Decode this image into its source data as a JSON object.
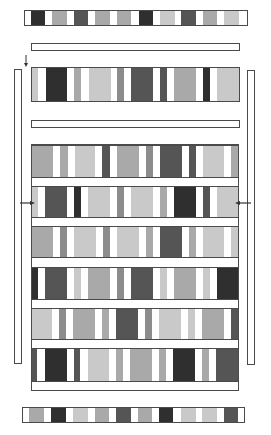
{
  "palette": {
    "W": "#ffffff",
    "D": "#2f2f2f",
    "DM": "#555555",
    "M": "#8c8c8c",
    "ML": "#a9a9a9",
    "L": "#c9c9c9",
    "border": "#4a4a4a"
  },
  "top_strip": {
    "box": [
      24,
      10,
      224,
      16
    ],
    "segments": [
      [
        24,
        31,
        "W"
      ],
      [
        31,
        45,
        "D"
      ],
      [
        45,
        52,
        "W"
      ],
      [
        52,
        67,
        "ML"
      ],
      [
        67,
        74,
        "W"
      ],
      [
        74,
        88,
        "DM"
      ],
      [
        88,
        95,
        "W"
      ],
      [
        95,
        110,
        "ML"
      ],
      [
        110,
        117,
        "W"
      ],
      [
        117,
        131,
        "ML"
      ],
      [
        131,
        139,
        "W"
      ],
      [
        139,
        153,
        "D"
      ],
      [
        153,
        160,
        "W"
      ],
      [
        160,
        175,
        "L"
      ],
      [
        175,
        181,
        "W"
      ],
      [
        181,
        196,
        "DM"
      ],
      [
        196,
        203,
        "W"
      ],
      [
        203,
        217,
        "ML"
      ],
      [
        217,
        224,
        "W"
      ],
      [
        224,
        239,
        "L"
      ],
      [
        239,
        248,
        "W"
      ]
    ]
  },
  "separator_bars": [
    {
      "box": [
        31,
        43,
        209,
        8
      ]
    },
    {
      "box": [
        31,
        120,
        209,
        8
      ]
    }
  ],
  "arrows": [
    {
      "name": "entry-arrow-down",
      "direction": "down",
      "x": 26,
      "y1": 55,
      "y2": 67
    },
    {
      "name": "left-arrow-right",
      "direction": "right",
      "y": 203,
      "x1": 20,
      "x2": 35
    },
    {
      "name": "right-arrow-left",
      "direction": "left",
      "y": 203,
      "x1": 251,
      "x2": 235
    }
  ],
  "side_bars": [
    {
      "name": "left-vertical-bar",
      "box": [
        14,
        69,
        8,
        295
      ]
    },
    {
      "name": "right-vertical-bar",
      "box": [
        247,
        70,
        8,
        295
      ]
    }
  ],
  "single_band": {
    "box": [
      31,
      67,
      209,
      35
    ],
    "segments": [
      [
        31,
        38,
        "L"
      ],
      [
        38,
        46,
        "W"
      ],
      [
        46,
        67,
        "D"
      ],
      [
        67,
        74,
        "W"
      ],
      [
        74,
        81,
        "ML"
      ],
      [
        81,
        89,
        "W"
      ],
      [
        89,
        111,
        "L"
      ],
      [
        111,
        117,
        "W"
      ],
      [
        117,
        124,
        "M"
      ],
      [
        124,
        131,
        "W"
      ],
      [
        131,
        153,
        "DM"
      ],
      [
        153,
        160,
        "W"
      ],
      [
        160,
        167,
        "DM"
      ],
      [
        167,
        174,
        "W"
      ],
      [
        174,
        196,
        "ML"
      ],
      [
        196,
        203,
        "W"
      ],
      [
        203,
        210,
        "D"
      ],
      [
        210,
        217,
        "W"
      ],
      [
        217,
        240,
        "L"
      ]
    ]
  },
  "grid": {
    "box": [
      31,
      144,
      208,
      247
    ],
    "rows": [
      {
        "y": 145,
        "h": 33,
        "segments": [
          [
            31,
            53,
            "ML"
          ],
          [
            53,
            60,
            "W"
          ],
          [
            60,
            68,
            "ML"
          ],
          [
            68,
            75,
            "W"
          ],
          [
            75,
            95,
            "L"
          ],
          [
            95,
            102,
            "W"
          ],
          [
            102,
            110,
            "DM"
          ],
          [
            110,
            117,
            "W"
          ],
          [
            117,
            139,
            "ML"
          ],
          [
            139,
            146,
            "W"
          ],
          [
            146,
            153,
            "M"
          ],
          [
            153,
            160,
            "W"
          ],
          [
            160,
            182,
            "DM"
          ],
          [
            182,
            189,
            "W"
          ],
          [
            189,
            196,
            "DM"
          ],
          [
            196,
            203,
            "W"
          ],
          [
            203,
            224,
            "L"
          ],
          [
            224,
            231,
            "W"
          ],
          [
            231,
            239,
            "ML"
          ]
        ]
      },
      {
        "y": 186,
        "h": 32,
        "segments": [
          [
            31,
            38,
            "L"
          ],
          [
            38,
            45,
            "W"
          ],
          [
            45,
            67,
            "DM"
          ],
          [
            67,
            74,
            "W"
          ],
          [
            74,
            81,
            "D"
          ],
          [
            81,
            88,
            "W"
          ],
          [
            88,
            110,
            "L"
          ],
          [
            110,
            117,
            "W"
          ],
          [
            117,
            124,
            "M"
          ],
          [
            124,
            131,
            "W"
          ],
          [
            131,
            153,
            "L"
          ],
          [
            153,
            160,
            "W"
          ],
          [
            160,
            167,
            "ML"
          ],
          [
            167,
            174,
            "W"
          ],
          [
            174,
            196,
            "D"
          ],
          [
            196,
            203,
            "W"
          ],
          [
            203,
            210,
            "DM"
          ],
          [
            210,
            217,
            "W"
          ],
          [
            217,
            239,
            "L"
          ]
        ]
      },
      {
        "y": 226,
        "h": 32,
        "segments": [
          [
            31,
            53,
            "ML"
          ],
          [
            53,
            60,
            "W"
          ],
          [
            60,
            67,
            "M"
          ],
          [
            67,
            74,
            "W"
          ],
          [
            74,
            96,
            "L"
          ],
          [
            96,
            103,
            "W"
          ],
          [
            103,
            110,
            "M"
          ],
          [
            110,
            117,
            "W"
          ],
          [
            117,
            139,
            "L"
          ],
          [
            139,
            146,
            "W"
          ],
          [
            146,
            153,
            "ML"
          ],
          [
            153,
            160,
            "W"
          ],
          [
            160,
            182,
            "DM"
          ],
          [
            182,
            189,
            "W"
          ],
          [
            189,
            196,
            "ML"
          ],
          [
            196,
            203,
            "W"
          ],
          [
            203,
            224,
            "L"
          ],
          [
            224,
            231,
            "W"
          ],
          [
            231,
            239,
            "L"
          ]
        ]
      },
      {
        "y": 267,
        "h": 33,
        "segments": [
          [
            31,
            38,
            "D"
          ],
          [
            38,
            45,
            "W"
          ],
          [
            45,
            67,
            "DM"
          ],
          [
            67,
            74,
            "W"
          ],
          [
            74,
            81,
            "L"
          ],
          [
            81,
            88,
            "W"
          ],
          [
            88,
            110,
            "ML"
          ],
          [
            110,
            117,
            "W"
          ],
          [
            117,
            124,
            "M"
          ],
          [
            124,
            131,
            "W"
          ],
          [
            131,
            153,
            "DM"
          ],
          [
            153,
            160,
            "W"
          ],
          [
            160,
            167,
            "L"
          ],
          [
            167,
            174,
            "W"
          ],
          [
            174,
            196,
            "ML"
          ],
          [
            196,
            203,
            "W"
          ],
          [
            203,
            210,
            "L"
          ],
          [
            210,
            217,
            "W"
          ],
          [
            217,
            239,
            "D"
          ]
        ]
      },
      {
        "y": 308,
        "h": 32,
        "segments": [
          [
            31,
            52,
            "L"
          ],
          [
            52,
            59,
            "W"
          ],
          [
            59,
            66,
            "M"
          ],
          [
            66,
            73,
            "W"
          ],
          [
            73,
            95,
            "ML"
          ],
          [
            95,
            102,
            "W"
          ],
          [
            102,
            109,
            "ML"
          ],
          [
            109,
            116,
            "W"
          ],
          [
            116,
            138,
            "DM"
          ],
          [
            138,
            145,
            "W"
          ],
          [
            145,
            152,
            "M"
          ],
          [
            152,
            159,
            "W"
          ],
          [
            159,
            181,
            "L"
          ],
          [
            181,
            188,
            "W"
          ],
          [
            188,
            195,
            "L"
          ],
          [
            195,
            202,
            "W"
          ],
          [
            202,
            224,
            "ML"
          ],
          [
            224,
            231,
            "W"
          ],
          [
            231,
            239,
            "DM"
          ]
        ]
      },
      {
        "y": 348,
        "h": 34,
        "segments": [
          [
            31,
            37,
            "DM"
          ],
          [
            37,
            45,
            "W"
          ],
          [
            45,
            67,
            "D"
          ],
          [
            67,
            74,
            "W"
          ],
          [
            74,
            80,
            "DM"
          ],
          [
            80,
            88,
            "W"
          ],
          [
            88,
            109,
            "L"
          ],
          [
            109,
            116,
            "W"
          ],
          [
            116,
            123,
            "ML"
          ],
          [
            123,
            130,
            "W"
          ],
          [
            130,
            152,
            "ML"
          ],
          [
            152,
            159,
            "W"
          ],
          [
            159,
            166,
            "ML"
          ],
          [
            166,
            173,
            "W"
          ],
          [
            173,
            195,
            "D"
          ],
          [
            195,
            202,
            "W"
          ],
          [
            202,
            209,
            "ML"
          ],
          [
            209,
            216,
            "W"
          ],
          [
            216,
            239,
            "DM"
          ]
        ]
      }
    ]
  },
  "bottom_strip": {
    "box": [
      22,
      407,
      223,
      16
    ],
    "segments": [
      [
        22,
        29,
        "W"
      ],
      [
        29,
        44,
        "ML"
      ],
      [
        44,
        51,
        "W"
      ],
      [
        51,
        66,
        "D"
      ],
      [
        66,
        73,
        "W"
      ],
      [
        73,
        88,
        "L"
      ],
      [
        88,
        95,
        "W"
      ],
      [
        95,
        109,
        "ML"
      ],
      [
        109,
        116,
        "W"
      ],
      [
        116,
        131,
        "DM"
      ],
      [
        131,
        138,
        "W"
      ],
      [
        138,
        152,
        "ML"
      ],
      [
        152,
        159,
        "W"
      ],
      [
        159,
        173,
        "D"
      ],
      [
        173,
        181,
        "W"
      ],
      [
        181,
        196,
        "L"
      ],
      [
        196,
        202,
        "W"
      ],
      [
        202,
        217,
        "L"
      ],
      [
        217,
        224,
        "W"
      ],
      [
        224,
        238,
        "DM"
      ],
      [
        238,
        245,
        "W"
      ]
    ]
  }
}
